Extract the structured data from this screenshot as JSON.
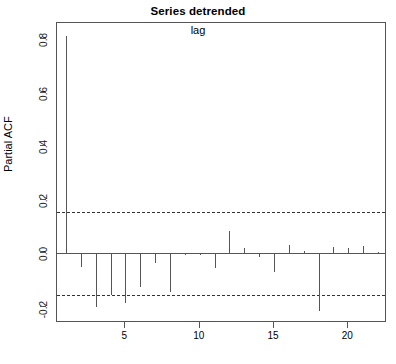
{
  "chart_data": {
    "type": "bar",
    "title": "Series detrended",
    "xlabel": "lag",
    "ylabel": "Partial ACF",
    "grid": false,
    "legend": null,
    "xlim": [
      0.4,
      22.6
    ],
    "ylim": [
      -0.26,
      0.86
    ],
    "x_ticks": [
      5,
      10,
      15,
      20
    ],
    "x_tick_labels": [
      "5",
      "10",
      "15",
      "20"
    ],
    "y_ticks": [
      -0.2,
      0.0,
      0.2,
      0.4,
      0.6,
      0.8
    ],
    "y_tick_labels": [
      "-0.2",
      "0.0",
      "0.2",
      "0.4",
      "0.6",
      "0.8"
    ],
    "zero_line": 0.0,
    "confidence_bounds": [
      0.155,
      -0.155
    ],
    "confidence_line_style": "dashed",
    "series_color": "#555555",
    "x": [
      1,
      2,
      3,
      4,
      5,
      6,
      7,
      8,
      9,
      10,
      11,
      12,
      13,
      14,
      15,
      16,
      17,
      18,
      19,
      20,
      21,
      22
    ],
    "values": [
      0.81,
      -0.05,
      -0.2,
      -0.155,
      -0.185,
      -0.125,
      -0.035,
      -0.145,
      -0.005,
      -0.005,
      -0.055,
      0.085,
      0.02,
      -0.012,
      -0.07,
      0.03,
      0.008,
      -0.215,
      0.022,
      0.02,
      0.028,
      0.006
    ],
    "categories": [
      "1",
      "2",
      "3",
      "4",
      "5",
      "6",
      "7",
      "8",
      "9",
      "10",
      "11",
      "12",
      "13",
      "14",
      "15",
      "16",
      "17",
      "18",
      "19",
      "20",
      "21",
      "22"
    ]
  }
}
